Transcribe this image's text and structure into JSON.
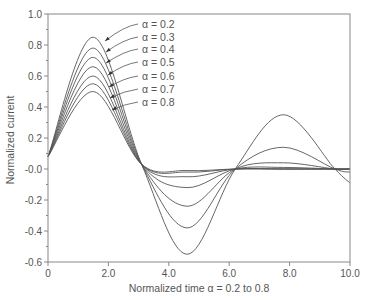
{
  "chart_data": {
    "type": "line",
    "title": "",
    "xlabel": "Normalized time α = 0.2 to 0.8",
    "ylabel": "Normalized current",
    "xlim": [
      0,
      10
    ],
    "ylim": [
      -0.6,
      1.0
    ],
    "grid": false,
    "x_ticks": [
      "0",
      "2.0",
      "4.0",
      "6.0",
      "8.0",
      "10.0"
    ],
    "y_ticks": [
      "1.0",
      "0.8",
      "0.6",
      "0.4",
      "0.2",
      "-0.0",
      "-0.2",
      "-0.4",
      "-0.6"
    ],
    "legend_position": "annotations with arrows, upper-left inside plot",
    "series": [
      {
        "name": "α = 0.2",
        "x": [
          0,
          1.5,
          3.1,
          4.6,
          6.2,
          7.8,
          9.5,
          10
        ],
        "values": [
          0.08,
          0.85,
          0.03,
          -0.55,
          0.0,
          0.35,
          0.0,
          -0.09
        ]
      },
      {
        "name": "α = 0.3",
        "x": [
          0,
          1.5,
          3.1,
          4.6,
          6.2,
          7.8,
          9.5,
          10
        ],
        "values": [
          0.08,
          0.78,
          0.03,
          -0.38,
          0.0,
          0.14,
          0.0,
          -0.02
        ]
      },
      {
        "name": "α = 0.4",
        "x": [
          0,
          1.5,
          3.1,
          4.6,
          6.2,
          7.8,
          9.5,
          10
        ],
        "values": [
          0.08,
          0.72,
          0.03,
          -0.24,
          0.0,
          0.04,
          0.0,
          0.0
        ]
      },
      {
        "name": "α = 0.5",
        "x": [
          0,
          1.5,
          3.1,
          4.6,
          6.2,
          7.8,
          9.5,
          10
        ],
        "values": [
          0.08,
          0.66,
          0.03,
          -0.12,
          0.0,
          0.01,
          0.0,
          0.0
        ]
      },
      {
        "name": "α = 0.6",
        "x": [
          0,
          1.5,
          3.1,
          4.6,
          6.2,
          7.8,
          9.5,
          10
        ],
        "values": [
          0.08,
          0.6,
          0.03,
          -0.05,
          0.0,
          0.0,
          0.0,
          0.0
        ]
      },
      {
        "name": "α = 0.7",
        "x": [
          0,
          1.5,
          3.1,
          4.6,
          6.2,
          7.8,
          9.5,
          10
        ],
        "values": [
          0.08,
          0.55,
          0.03,
          -0.02,
          0.0,
          0.0,
          0.0,
          0.0
        ]
      },
      {
        "name": "α = 0.8",
        "x": [
          0,
          1.5,
          3.1,
          4.6,
          6.2,
          7.8,
          9.5,
          10
        ],
        "values": [
          0.08,
          0.5,
          0.03,
          -0.01,
          0.0,
          0.0,
          0.0,
          0.0
        ]
      }
    ],
    "colors": {
      "axis": "#777777",
      "line": "#555555",
      "text": "#555555"
    }
  },
  "labels": {
    "xlabel": "Normalized time α = 0.2 to 0.8",
    "ylabel": "Normalized current",
    "alpha": [
      "α = 0.2",
      "α = 0.3",
      "α = 0.4",
      "α = 0.5",
      "α = 0.6",
      "α = 0.7",
      "α = 0.8"
    ]
  }
}
